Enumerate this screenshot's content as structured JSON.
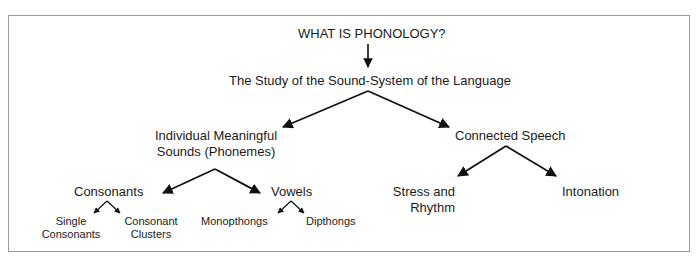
{
  "diagram": {
    "root": "WHAT IS PHONOLOGY?",
    "definition": "The Study of the Sound-System of the Language",
    "branches": {
      "individual": {
        "line1": "Individual Meaningful",
        "line2": "Sounds (Phonemes)",
        "children": {
          "consonants": {
            "label": "Consonants",
            "children": {
              "single": {
                "line1": "Single",
                "line2": "Consonants"
              },
              "clusters": {
                "line1": "Consonant",
                "line2": "Clusters"
              }
            }
          },
          "vowels": {
            "label": "Vowels",
            "children": {
              "monopthongs": {
                "label": "Monopthongs"
              },
              "dipthongs": {
                "label": "Dipthongs"
              }
            }
          }
        }
      },
      "connected": {
        "label": "Connected Speech",
        "children": {
          "stress": {
            "line1": "Stress and",
            "line2": "Rhythm"
          },
          "intonation": {
            "label": "Intonation"
          }
        }
      }
    },
    "colors": {
      "text": "#1a1a1a",
      "arrow": "#111111",
      "frame": "#9a9a9a",
      "background": "#ffffff"
    }
  }
}
